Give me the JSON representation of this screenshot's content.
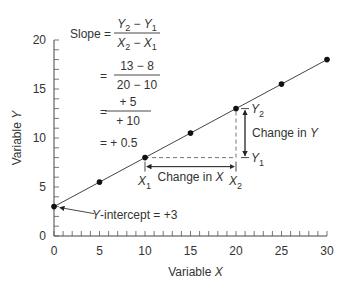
{
  "chart_data": {
    "type": "line",
    "title": "",
    "xlabel": "Variable X",
    "ylabel": "Variable Y",
    "xlim": [
      0,
      30
    ],
    "ylim": [
      0,
      20
    ],
    "x_ticks": [
      0,
      5,
      10,
      15,
      20,
      25,
      30
    ],
    "y_ticks": [
      0,
      5,
      10,
      15,
      20
    ],
    "grid": false,
    "series": [
      {
        "name": "Y = 3 + 0.5X",
        "x": [
          0,
          5,
          10,
          15,
          20,
          25,
          30
        ],
        "y": [
          3,
          5.5,
          8,
          10.5,
          13,
          15.5,
          18
        ]
      }
    ],
    "annotations": {
      "slope_formula": {
        "line1_label": "Slope =",
        "line1_num": "Y2 − Y1",
        "line1_den": "X2 − X1",
        "line2_num": "13 − 8",
        "line2_den": "20 − 10",
        "line3_num": "+ 5",
        "line3_den": "+ 10",
        "line4": "= + 0.5"
      },
      "y_intercept": "Y-intercept = +3",
      "change_in_x": "Change in X",
      "change_in_y": "Change in Y",
      "point_labels": {
        "x1": "X",
        "x2": "X",
        "y1": "Y",
        "y2": "Y",
        "sub1": "1",
        "sub2": "2"
      }
    }
  }
}
